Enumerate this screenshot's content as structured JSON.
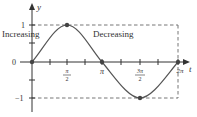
{
  "diagram": {
    "function": "y = sin t",
    "axes": {
      "x_label": "t",
      "y_label": "y",
      "y_ticks": [
        {
          "label": "1",
          "value": 1
        },
        {
          "label": "0",
          "value": 0
        },
        {
          "label": "−1",
          "value": -1
        }
      ],
      "x_ticks": [
        {
          "num": "π",
          "den": "2",
          "value": "pi/2"
        },
        {
          "label": "π",
          "value": "pi"
        },
        {
          "num": "3π",
          "den": "2",
          "value": "3pi/2"
        },
        {
          "label": "2π",
          "value": "2pi"
        }
      ]
    },
    "annotations": {
      "increasing": "Increasing",
      "decreasing": "Decreasing"
    },
    "key_points": [
      {
        "t": "0",
        "y": 0
      },
      {
        "t": "π/2",
        "y": 1
      },
      {
        "t": "π",
        "y": 0
      },
      {
        "t": "3π/2",
        "y": -1
      },
      {
        "t": "2π",
        "y": 0
      }
    ],
    "colors": {
      "curve": "#555555",
      "axes": "#333333",
      "dashed": "#666666",
      "points": "#555555"
    }
  }
}
